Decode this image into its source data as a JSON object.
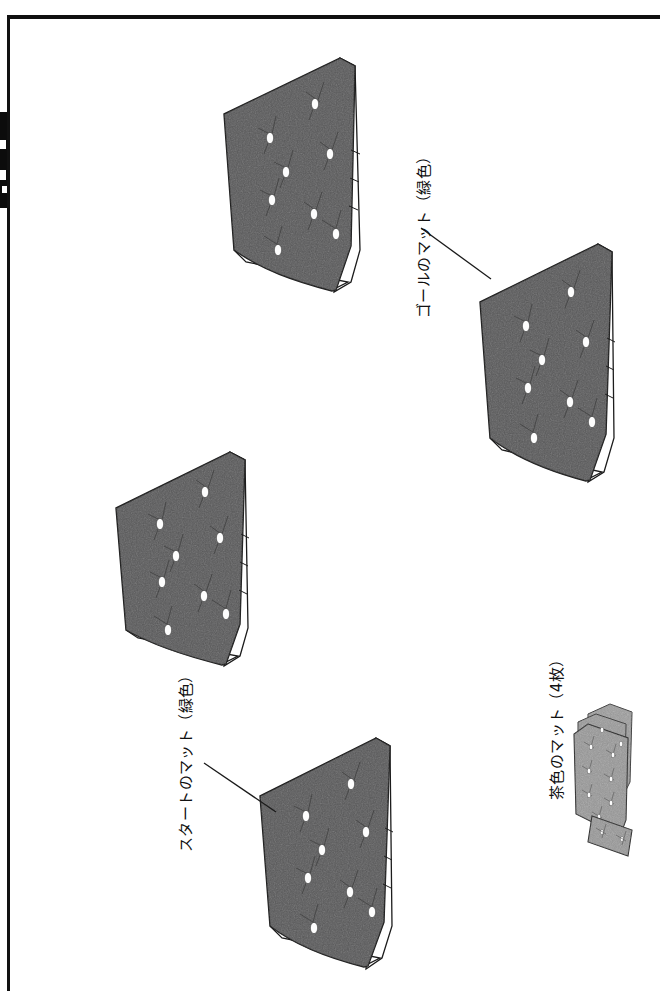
{
  "page": {
    "background_color": "#ffffff",
    "border_color": "#101010"
  },
  "colors": {
    "green_mat_fill": "#585859",
    "green_mat_fill_dark": "#4c4c4d",
    "brown_mat_fill": "#989898",
    "brown_mat_fill_dark": "#8a8a8a",
    "mat_outline": "#1c1c1c",
    "tuft_dot": "#fdfdfd",
    "leader_line": "#1a1a1a",
    "text": "#111111"
  },
  "labels": [
    {
      "id": "goal-mat",
      "text": "ゴールのマット（緑色）",
      "x": 424,
      "y": 318,
      "leader": {
        "x1": 421,
        "y1": 228,
        "x2": 491,
        "y2": 279
      }
    },
    {
      "id": "start-mat",
      "text": "スタートのマット（緑色）",
      "x": 186,
      "y": 852,
      "leader": {
        "x1": 204,
        "y1": 763,
        "x2": 276,
        "y2": 812
      }
    },
    {
      "id": "brown-mats",
      "text": "茶色のマット（4枚）",
      "x": 545,
      "y": 800,
      "leader": null
    }
  ],
  "mats": [
    {
      "id": "mat-top-center",
      "kind": "green",
      "label_ref": null,
      "tuft_count": 8,
      "position": {
        "x": 224,
        "y": 58
      },
      "size": {
        "w": 130,
        "h": 245
      }
    },
    {
      "id": "mat-goal",
      "kind": "green",
      "label_ref": "goal-mat",
      "tuft_count": 8,
      "position": {
        "x": 470,
        "y": 238
      },
      "size": {
        "w": 130,
        "h": 248
      }
    },
    {
      "id": "mat-middle-left",
      "kind": "green",
      "label_ref": null,
      "tuft_count": 8,
      "position": {
        "x": 116,
        "y": 449
      },
      "size": {
        "w": 132,
        "h": 228
      }
    },
    {
      "id": "mat-start",
      "kind": "green",
      "label_ref": "start-mat",
      "tuft_count": 8,
      "position": {
        "x": 255,
        "y": 735
      },
      "size": {
        "w": 130,
        "h": 240
      }
    },
    {
      "id": "mat-brown-stack",
      "kind": "brown",
      "label_ref": "brown-mats",
      "sheet_count": 4,
      "tuft_count": 9,
      "position": {
        "x": 572,
        "y": 707
      },
      "size": {
        "w": 70,
        "h": 160
      }
    }
  ]
}
